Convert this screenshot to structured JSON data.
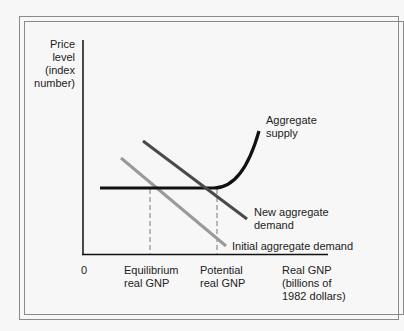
{
  "diagram": {
    "y_axis_label": "Price\nlevel\n(index\nnumber)",
    "x_axis_label": "Real GNP\n(billions of\n1982 dollars)",
    "origin_label": "0",
    "x_ticks": {
      "equilibrium": "Equilibrium\nreal GNP",
      "potential": "Potential\nreal GNP"
    },
    "curves": {
      "aggregate_supply": "Aggregate\nsupply",
      "new_aggregate_demand": "New aggregate\ndemand",
      "initial_aggregate_demand": "Initial aggregate demand"
    },
    "colors": {
      "supply": "#111111",
      "new_demand": "#4a4a4a",
      "initial_demand": "#9a9a9a",
      "axis": "#111111",
      "dashed": "#777777",
      "frame": "#8a8a8a",
      "background": "#f7f7f7"
    }
  }
}
